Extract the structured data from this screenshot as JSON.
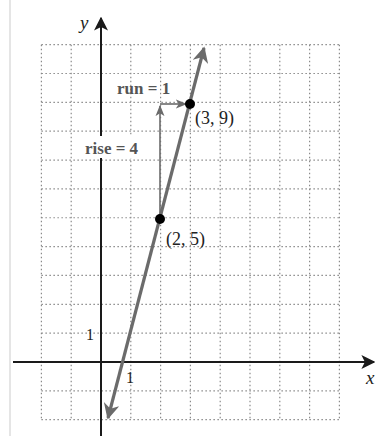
{
  "figure": {
    "axis_labels": {
      "x": "x",
      "y": "y"
    },
    "tick_labels": {
      "x_unit": "1",
      "y_unit": "1"
    },
    "points": [
      {
        "label": "(2, 5)",
        "x": 2,
        "y": 5
      },
      {
        "label": "(3, 9)",
        "x": 3,
        "y": 9
      }
    ],
    "annotations": {
      "rise": "rise = 4",
      "run": "run = 1"
    },
    "grid": {
      "x_min": -2,
      "x_max": 8,
      "y_min": -2,
      "y_max": 11
    },
    "line": {
      "slope": 4,
      "intercept": -3,
      "equation": "y = 4x - 3"
    },
    "colors": {
      "line": "#6b6b6b",
      "axis": "#1a1a1a",
      "grid": "#8a8a8a",
      "point": "#000000",
      "annotation_text": "#555555",
      "label_text": "#222222"
    }
  }
}
